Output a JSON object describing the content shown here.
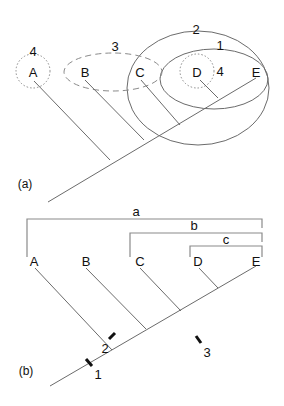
{
  "panels": [
    {
      "id": "a",
      "caption": "(a)",
      "taxa": [
        "A",
        "B",
        "C",
        "D",
        "E"
      ],
      "groupings": [
        {
          "label": "1",
          "style": "solid",
          "members": [
            "D",
            "E"
          ]
        },
        {
          "label": "2",
          "style": "solid",
          "members": [
            "C",
            "D",
            "E"
          ]
        },
        {
          "label": "3",
          "style": "dashed",
          "members": [
            "B",
            "C"
          ]
        },
        {
          "label": "4",
          "style": "dotted",
          "members": [
            "A"
          ]
        },
        {
          "label": "4",
          "style": "dotted",
          "members": [
            "D"
          ]
        }
      ]
    },
    {
      "id": "b",
      "caption": "(b)",
      "taxa": [
        "A",
        "B",
        "C",
        "D",
        "E"
      ],
      "clades": [
        {
          "label": "a",
          "members": [
            "A",
            "B",
            "C",
            "D",
            "E"
          ]
        },
        {
          "label": "b",
          "members": [
            "C",
            "D",
            "E"
          ]
        },
        {
          "label": "c",
          "members": [
            "D",
            "E"
          ]
        }
      ],
      "character_marks": [
        {
          "label": "1",
          "position": "main stem"
        },
        {
          "label": "2",
          "position": "branch B"
        },
        {
          "label": "3",
          "position": "stem of C-D-E"
        }
      ]
    }
  ],
  "colors": {
    "line": "#6b6b6b",
    "text": "#111111",
    "tick": "#111111"
  }
}
